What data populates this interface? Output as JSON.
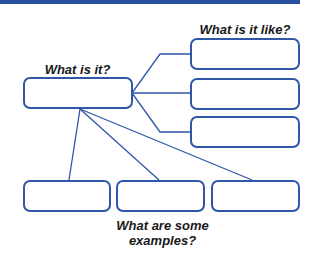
{
  "diagram": {
    "labels": {
      "center": "What is it?",
      "right": "What is it like?",
      "bottom_line1": "What are some",
      "bottom_line2": "examples?"
    },
    "colors": {
      "accent": "#2f56a8",
      "topbar": "#2a4f9e",
      "text": "#1a1a1a"
    },
    "boxes": {
      "center": "",
      "right": [
        "",
        "",
        ""
      ],
      "bottom": [
        "",
        "",
        ""
      ]
    }
  }
}
